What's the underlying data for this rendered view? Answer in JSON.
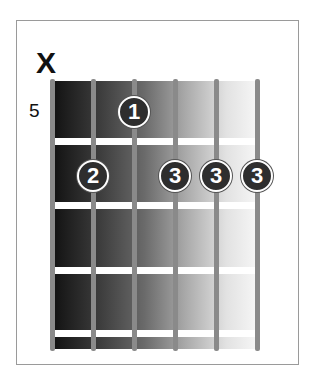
{
  "chord": {
    "muted_label": "X",
    "start_fret": "5",
    "strings": [
      52,
      93,
      134,
      175,
      216,
      257
    ],
    "frets_y": [
      141,
      205,
      270,
      333
    ],
    "fingers": [
      {
        "finger": "1",
        "string": 3,
        "fret": 1
      },
      {
        "finger": "2",
        "string": 2,
        "fret": 2
      },
      {
        "finger": "3",
        "string": 4,
        "fret": 2
      },
      {
        "finger": "3",
        "string": 5,
        "fret": 2
      },
      {
        "finger": "3",
        "string": 6,
        "fret": 2
      }
    ],
    "colors": {
      "dot_fill": "#2e2e2e",
      "dot_text": "#ffffff",
      "string": "#8a8a8a"
    }
  }
}
